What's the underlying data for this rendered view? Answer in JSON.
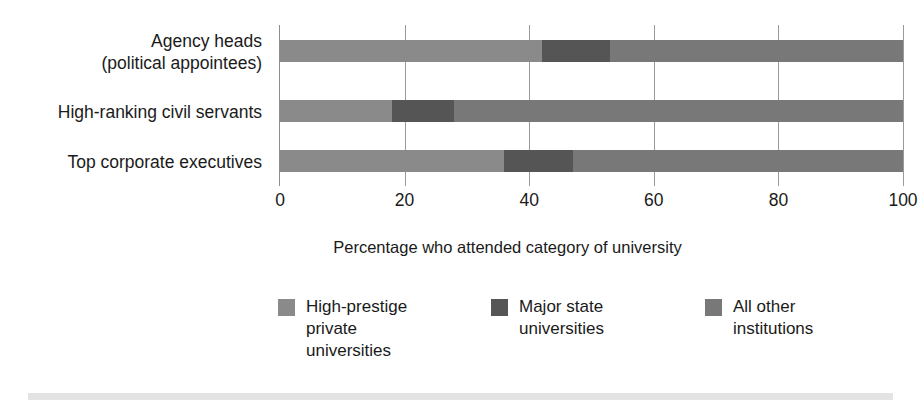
{
  "chart_data": {
    "type": "bar",
    "orientation": "horizontal",
    "stacked": true,
    "title": "",
    "xlabel": "Percentage who attended category of university",
    "ylabel": "",
    "xlim": [
      0,
      100
    ],
    "xticks": [
      0,
      20,
      40,
      60,
      80,
      100
    ],
    "xtick_labels": [
      "0",
      "20",
      "40",
      "60",
      "80",
      "100"
    ],
    "grid": true,
    "grid_axis": "x",
    "legend_position": "bottom",
    "categories": [
      "Agency heads (political appointees)",
      "High-ranking civil servants",
      "Top corporate executives"
    ],
    "series": [
      {
        "name": "High-prestige private universities",
        "color": "#8a8a8a",
        "values": [
          42,
          18,
          36
        ]
      },
      {
        "name": "Major state universities",
        "color": "#555555",
        "values": [
          11,
          10,
          11
        ]
      },
      {
        "name": "All other institutions",
        "color": "#787878",
        "values": [
          47,
          72,
          53
        ]
      }
    ]
  },
  "axis": {
    "x_title": "Percentage who attended category of university",
    "tick_labels": [
      "0",
      "20",
      "40",
      "60",
      "80",
      "100"
    ]
  },
  "categories": [
    {
      "line1": "Agency heads",
      "line2": "(political appointees)"
    },
    {
      "line1": "High-ranking civil servants",
      "line2": ""
    },
    {
      "line1": "Top corporate executives",
      "line2": ""
    }
  ],
  "legend": {
    "items": [
      {
        "label_line1": "High-prestige",
        "label_line2": "private",
        "label_line3": "universities",
        "color": "#8a8a8a"
      },
      {
        "label_line1": "Major state",
        "label_line2": "universities",
        "label_line3": "",
        "color": "#555555"
      },
      {
        "label_line1": "All other",
        "label_line2": "institutions",
        "label_line3": "",
        "color": "#787878"
      }
    ]
  },
  "colors": {
    "series_high_prestige": "#8a8a8a",
    "series_major_state": "#555555",
    "series_all_other": "#787878",
    "gridline": "#9a9a9a",
    "axis": "#8d8d8d",
    "bottom_band": "#e3e3e3",
    "text": "#1a1a1a",
    "background": "#ffffff"
  }
}
